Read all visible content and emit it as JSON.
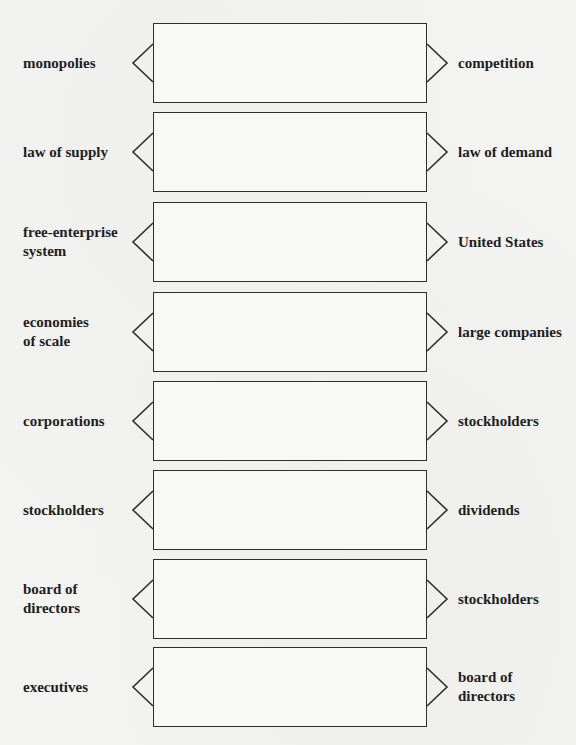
{
  "organizer": {
    "rows": [
      {
        "left": "monopolies",
        "right": "competition",
        "box_text": ""
      },
      {
        "left": "law of supply",
        "right": "law of demand",
        "box_text": ""
      },
      {
        "left": "free-enterprise\nsystem",
        "right": "United States",
        "box_text": ""
      },
      {
        "left": "economies\nof scale",
        "right": "large companies",
        "box_text": ""
      },
      {
        "left": "corporations",
        "right": "stockholders",
        "box_text": ""
      },
      {
        "left": "stockholders",
        "right": "dividends",
        "box_text": ""
      },
      {
        "left": "board of\ndirectors",
        "right": "stockholders",
        "box_text": ""
      },
      {
        "left": "executives",
        "right": "board of\ndirectors",
        "box_text": ""
      }
    ]
  },
  "colors": {
    "background": "#f3f3f1",
    "box_fill": "#f8f8f6",
    "line": "#2e2e2e",
    "text": "#1e1e1e"
  }
}
